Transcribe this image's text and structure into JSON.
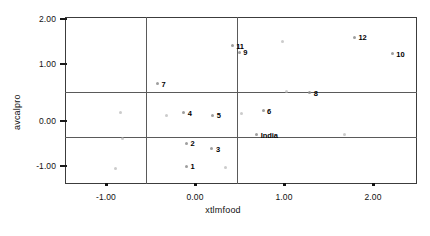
{
  "chart_data": {
    "type": "scatter",
    "title": "",
    "xlabel": "xtlmfood",
    "ylabel": "avcalpro",
    "xlim": [
      -1.45,
      2.55
    ],
    "ylim": [
      -1.62,
      2.12
    ],
    "xticks": [
      "-1.00",
      "0.00",
      "1.00",
      "2.00"
    ],
    "xtick_values": [
      -1.0,
      0.0,
      1.0,
      2.0
    ],
    "yticks": [
      "2.00",
      "1.00",
      "0.00",
      "-1.00"
    ],
    "ytick_values": [
      2.0,
      1.0,
      0.0,
      -1.0
    ],
    "grid": false,
    "legend": "none",
    "reference_lines": {
      "horizontal": [
        0.5,
        -0.5
      ],
      "vertical": [
        -0.53,
        0.5
      ]
    },
    "points": [
      {
        "label": "1",
        "x": -0.07,
        "y": -1.22
      },
      {
        "label": "2",
        "x": -0.07,
        "y": -0.71
      },
      {
        "label": "3",
        "x": 0.22,
        "y": -0.83
      },
      {
        "label": "4",
        "x": -0.1,
        "y": -0.02
      },
      {
        "label": "5",
        "x": 0.23,
        "y": -0.08
      },
      {
        "label": "6",
        "x": 0.8,
        "y": 0.02
      },
      {
        "label": "7",
        "x": -0.4,
        "y": 0.62
      },
      {
        "label": "8",
        "x": 1.33,
        "y": 0.42
      },
      {
        "label": "9",
        "x": 0.53,
        "y": 1.33
      },
      {
        "label": "10",
        "x": 2.27,
        "y": 1.3
      },
      {
        "label": "11",
        "x": 0.45,
        "y": 1.48
      },
      {
        "label": "12",
        "x": 1.84,
        "y": 1.67
      },
      {
        "label": "India",
        "x": 0.73,
        "y": -0.52
      }
    ],
    "unlabeled_points": [
      {
        "x": -0.88,
        "y": -1.27
      },
      {
        "x": -0.8,
        "y": -0.6
      },
      {
        "x": -0.82,
        "y": -0.02
      },
      {
        "x": -0.3,
        "y": -0.08
      },
      {
        "x": 0.37,
        "y": -1.25
      },
      {
        "x": 0.55,
        "y": -0.05
      },
      {
        "x": 1.07,
        "y": 0.45
      },
      {
        "x": 1.73,
        "y": -0.52
      },
      {
        "x": 1.02,
        "y": 1.58
      }
    ]
  }
}
